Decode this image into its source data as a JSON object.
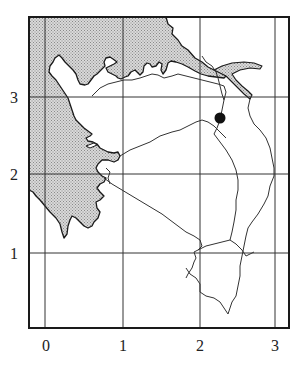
{
  "map": {
    "type": "grid-map",
    "x_axis": {
      "ticks": [
        "0",
        "1",
        "2",
        "3"
      ]
    },
    "y_axis": {
      "ticks": [
        "1",
        "2",
        "3"
      ]
    },
    "marker": {
      "shape": "filled-circle",
      "grid_x": 2.25,
      "grid_y": 2.7
    },
    "colors": {
      "frame": "#1a1a1a",
      "grid": "#333333",
      "sea_fill": "#c8c8c8",
      "coast": "#1a1a1a",
      "river": "#333333",
      "land": "#ffffff",
      "marker": "#111111"
    },
    "legend": []
  }
}
